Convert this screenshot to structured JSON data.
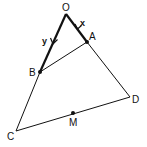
{
  "diagram": {
    "points": {
      "O": {
        "label": "O",
        "x": 66,
        "y": 14
      },
      "A": {
        "label": "A",
        "x": 87,
        "y": 42
      },
      "B": {
        "label": "B",
        "x": 40,
        "y": 72
      },
      "C": {
        "label": "C",
        "x": 16,
        "y": 131
      },
      "D": {
        "label": "D",
        "x": 130,
        "y": 97
      },
      "M": {
        "label": "M",
        "x": 73,
        "y": 113
      }
    },
    "vectors": {
      "OA": {
        "label": "x"
      },
      "OB": {
        "label": "y"
      }
    },
    "colors": {
      "line": "#111111",
      "background": "#ffffff"
    }
  }
}
